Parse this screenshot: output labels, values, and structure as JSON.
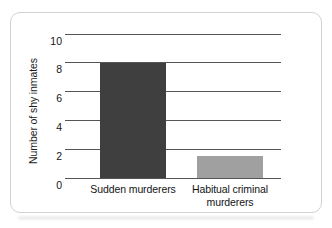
{
  "chart_data": {
    "type": "bar",
    "title": "",
    "subtitle": "",
    "xlabel": "",
    "ylabel": "Number of shy inmates",
    "categories": [
      "Sudden murderers",
      "Habitual criminal murderers"
    ],
    "category_lines": [
      [
        "Sudden murderers"
      ],
      [
        "Habitual criminal",
        "murderers"
      ]
    ],
    "values": [
      8,
      1.5
    ],
    "ylim": [
      0,
      10
    ],
    "yticks": [
      0,
      2,
      4,
      6,
      8,
      10
    ],
    "ytick_labels": [
      "0",
      "2",
      "4",
      "6",
      "8",
      "10"
    ],
    "grid": "horizontal",
    "legend": "none",
    "bar_colors": [
      "#3f3f3f",
      "#a0a0a0"
    ],
    "annotations": []
  },
  "figure": {
    "background_color": "#ffffff",
    "card_border_color": "#d2d2d2",
    "gridline_color": "#555555",
    "text_color": "#141414"
  }
}
